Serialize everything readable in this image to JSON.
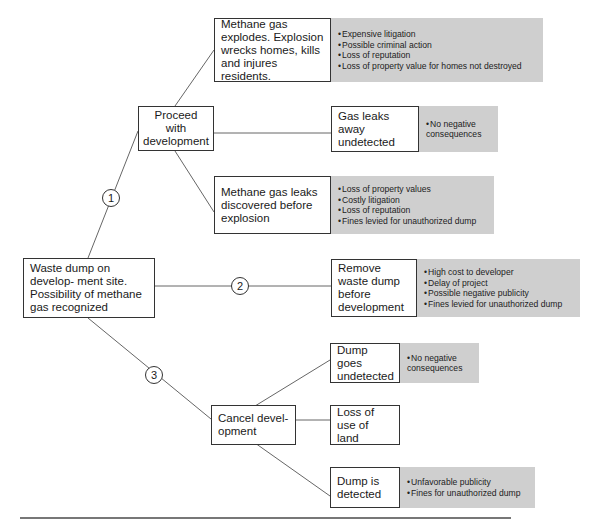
{
  "root": {
    "text": "Waste dump on develop- ment site. Possibility of methane gas recognized"
  },
  "options": [
    {
      "number": "1",
      "label": "Proceed with development",
      "events": [
        {
          "label": "Methane gas explodes. Explosion wrecks homes, kills and injures residents.",
          "consequences": [
            "Expensive litigation",
            "Possible criminal action",
            "Loss of reputation",
            "Loss of property value for homes not destroyed"
          ]
        },
        {
          "label": "Gas leaks away undetected",
          "consequences": [
            "No negative consequences"
          ]
        },
        {
          "label": "Methane gas leaks discovered before explosion",
          "consequences": [
            "Loss of property values",
            "Costly litigation",
            "Loss of reputation",
            "Fines levied for unauthorized dump"
          ]
        }
      ]
    },
    {
      "number": "2",
      "label": "Remove waste dump before development",
      "consequences": [
        "High cost to developer",
        "Delay of project",
        "Possible negative publicity",
        "Fines levied for unauthorized dump"
      ]
    },
    {
      "number": "3",
      "label": "Cancel devel- opment",
      "events": [
        {
          "label": "Dump goes undetected",
          "consequences": [
            "No negative consequences"
          ]
        },
        {
          "label": "Loss of use of land",
          "consequences": []
        },
        {
          "label": "Dump is detected",
          "consequences": [
            "Unfavorable publicity",
            "Fines for unauthorized dump"
          ]
        }
      ]
    }
  ],
  "colors": {
    "outcome_fill": "#cfcfcf",
    "line": "#555555",
    "border": "#333333"
  }
}
